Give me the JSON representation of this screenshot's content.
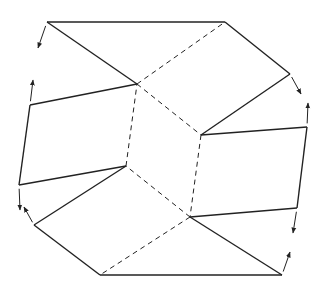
{
  "diagram": {
    "title": "",
    "stroke_color": "#222222",
    "background": "#ffffff",
    "center_face": [
      [
        137,
        84
      ],
      [
        201,
        135
      ],
      [
        190,
        217
      ],
      [
        126,
        166
      ]
    ],
    "solid_edges": [
      [
        [
          47,
          22
        ],
        [
          225,
          22
        ]
      ],
      [
        [
          47,
          22
        ],
        [
          137,
          84
        ]
      ],
      [
        [
          225,
          22
        ],
        [
          290,
          74
        ]
      ],
      [
        [
          290,
          74
        ],
        [
          201,
          135
        ]
      ],
      [
        [
          201,
          135
        ],
        [
          307,
          127
        ]
      ],
      [
        [
          307,
          127
        ],
        [
          297,
          208
        ]
      ],
      [
        [
          297,
          208
        ],
        [
          190,
          217
        ]
      ],
      [
        [
          190,
          217
        ],
        [
          282,
          275
        ]
      ],
      [
        [
          282,
          275
        ],
        [
          100,
          275
        ]
      ],
      [
        [
          100,
          275
        ],
        [
          34,
          225
        ]
      ],
      [
        [
          34,
          225
        ],
        [
          126,
          166
        ]
      ],
      [
        [
          126,
          166
        ],
        [
          19,
          185
        ]
      ],
      [
        [
          19,
          185
        ],
        [
          30,
          105
        ]
      ],
      [
        [
          30,
          105
        ],
        [
          137,
          84
        ]
      ]
    ],
    "dashed_edges": [
      [
        [
          137,
          84
        ],
        [
          225,
          22
        ]
      ],
      [
        [
          137,
          84
        ],
        [
          201,
          135
        ]
      ],
      [
        [
          201,
          135
        ],
        [
          190,
          217
        ]
      ],
      [
        [
          190,
          217
        ],
        [
          126,
          166
        ]
      ],
      [
        [
          126,
          166
        ],
        [
          137,
          84
        ]
      ],
      [
        [
          190,
          217
        ],
        [
          100,
          275
        ]
      ]
    ],
    "arrows": [
      {
        "from": [
          47,
          22
        ],
        "to": [
          38,
          48
        ]
      },
      {
        "from": [
          30,
          105
        ],
        "to": [
          33,
          80
        ]
      },
      {
        "from": [
          290,
          74
        ],
        "to": [
          301,
          94
        ]
      },
      {
        "from": [
          307,
          127
        ],
        "to": [
          308,
          103
        ]
      },
      {
        "from": [
          297,
          208
        ],
        "to": [
          293,
          233
        ]
      },
      {
        "from": [
          282,
          275
        ],
        "to": [
          290,
          252
        ]
      },
      {
        "from": [
          19,
          185
        ],
        "to": [
          20,
          210
        ]
      },
      {
        "from": [
          34,
          225
        ],
        "to": [
          24,
          207
        ]
      }
    ]
  }
}
